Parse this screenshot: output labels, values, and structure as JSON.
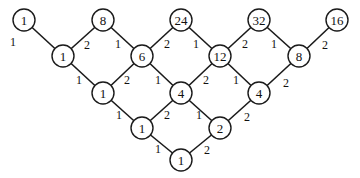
{
  "diagram": {
    "type": "weighted-lattice-graph",
    "node_radius": 11,
    "colors": {
      "stroke": "#1a1a1a",
      "fill": "#ffffff",
      "text": "#111111"
    },
    "nodes": [
      {
        "id": "r0c0",
        "label": "1",
        "x": 24,
        "y": 20
      },
      {
        "id": "r0c1",
        "label": "8",
        "x": 103,
        "y": 20
      },
      {
        "id": "r0c2",
        "label": "24",
        "x": 181,
        "y": 20
      },
      {
        "id": "r0c3",
        "label": "32",
        "x": 259,
        "y": 20
      },
      {
        "id": "r0c4",
        "label": "16",
        "x": 337,
        "y": 20
      },
      {
        "id": "r1c0",
        "label": "1",
        "x": 63,
        "y": 56
      },
      {
        "id": "r1c1",
        "label": "6",
        "x": 142,
        "y": 56
      },
      {
        "id": "r1c2",
        "label": "12",
        "x": 220,
        "y": 56
      },
      {
        "id": "r1c3",
        "label": "8",
        "x": 299,
        "y": 56
      },
      {
        "id": "r2c0",
        "label": "1",
        "x": 103,
        "y": 93
      },
      {
        "id": "r2c1",
        "label": "4",
        "x": 181,
        "y": 93
      },
      {
        "id": "r2c2",
        "label": "4",
        "x": 259,
        "y": 93
      },
      {
        "id": "r3c0",
        "label": "1",
        "x": 142,
        "y": 128
      },
      {
        "id": "r3c1",
        "label": "2",
        "x": 220,
        "y": 128
      },
      {
        "id": "r4c0",
        "label": "1",
        "x": 181,
        "y": 160
      }
    ],
    "edges": [
      {
        "from": "r0c0",
        "to": "r1c0",
        "label": "1",
        "lx": 10,
        "ly": 46
      },
      {
        "from": "r0c1",
        "to": "r1c0",
        "label": "2",
        "lx": 84,
        "ly": 49
      },
      {
        "from": "r0c1",
        "to": "r1c1",
        "label": "1",
        "lx": 115,
        "ly": 48
      },
      {
        "from": "r0c2",
        "to": "r1c1",
        "label": "2",
        "lx": 164,
        "ly": 48
      },
      {
        "from": "r0c2",
        "to": "r1c2",
        "label": "1",
        "lx": 193,
        "ly": 48
      },
      {
        "from": "r0c3",
        "to": "r1c2",
        "label": "2",
        "lx": 242,
        "ly": 48
      },
      {
        "from": "r0c3",
        "to": "r1c3",
        "label": "1",
        "lx": 271,
        "ly": 48
      },
      {
        "from": "r0c4",
        "to": "r1c3",
        "label": "2",
        "lx": 322,
        "ly": 49
      },
      {
        "from": "r1c0",
        "to": "r2c0",
        "label": "1",
        "lx": 76,
        "ly": 84
      },
      {
        "from": "r1c1",
        "to": "r2c0",
        "label": "2",
        "lx": 124,
        "ly": 84
      },
      {
        "from": "r1c1",
        "to": "r2c1",
        "label": "1",
        "lx": 155,
        "ly": 84
      },
      {
        "from": "r1c2",
        "to": "r2c1",
        "label": "2",
        "lx": 203,
        "ly": 84
      },
      {
        "from": "r1c2",
        "to": "r2c2",
        "label": "1",
        "lx": 233,
        "ly": 84
      },
      {
        "from": "r1c3",
        "to": "r2c2",
        "label": "2",
        "lx": 283,
        "ly": 87
      },
      {
        "from": "r2c0",
        "to": "r3c0",
        "label": "1",
        "lx": 116,
        "ly": 119
      },
      {
        "from": "r2c1",
        "to": "r3c0",
        "label": "2",
        "lx": 164,
        "ly": 119
      },
      {
        "from": "r2c1",
        "to": "r3c1",
        "label": "1",
        "lx": 196,
        "ly": 119
      },
      {
        "from": "r2c2",
        "to": "r3c1",
        "label": "2",
        "lx": 244,
        "ly": 121
      },
      {
        "from": "r3c0",
        "to": "r4c0",
        "label": "1",
        "lx": 155,
        "ly": 153
      },
      {
        "from": "r3c1",
        "to": "r4c0",
        "label": "2",
        "lx": 204,
        "ly": 154
      }
    ]
  }
}
